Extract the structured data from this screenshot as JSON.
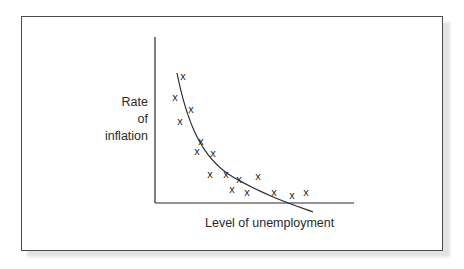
{
  "chart_data": {
    "type": "scatter",
    "title": "",
    "xlabel": "Level of unemployment",
    "ylabel": "Rate of inflation",
    "ylabel_lines": [
      "Rate",
      "of",
      "inflation"
    ],
    "grid": false,
    "legend": null,
    "ticks": "none",
    "marker": "x",
    "points_px": [
      {
        "x": 183,
        "y": 76
      },
      {
        "x": 175,
        "y": 97
      },
      {
        "x": 191,
        "y": 109
      },
      {
        "x": 180,
        "y": 121
      },
      {
        "x": 201,
        "y": 141
      },
      {
        "x": 197,
        "y": 151
      },
      {
        "x": 213,
        "y": 153
      },
      {
        "x": 210,
        "y": 174
      },
      {
        "x": 226,
        "y": 174
      },
      {
        "x": 239,
        "y": 179
      },
      {
        "x": 258,
        "y": 176
      },
      {
        "x": 232,
        "y": 189
      },
      {
        "x": 247,
        "y": 192
      },
      {
        "x": 274,
        "y": 192
      },
      {
        "x": 292,
        "y": 195
      },
      {
        "x": 306,
        "y": 192
      }
    ],
    "series": [
      {
        "name": "observations",
        "type": "scatter",
        "x": [
          0.14,
          0.1,
          0.18,
          0.13,
          0.23,
          0.21,
          0.29,
          0.28,
          0.36,
          0.42,
          0.52,
          0.39,
          0.46,
          0.6,
          0.69,
          0.76
        ],
        "y": [
          0.77,
          0.64,
          0.57,
          0.49,
          0.37,
          0.31,
          0.3,
          0.17,
          0.17,
          0.14,
          0.16,
          0.08,
          0.07,
          0.07,
          0.05,
          0.07
        ]
      },
      {
        "name": "Phillips curve",
        "type": "line",
        "shape": "convex decreasing curve (hyperbola-like), crosses the x-axis near the right",
        "path_px": "M177,73 C186,118 200,158 233,177 C262,194 288,203 313,212"
      }
    ],
    "axes_px": {
      "origin": {
        "x": 155,
        "y": 203
      },
      "y_top": 37,
      "x_right": 354
    },
    "xlim": [
      0,
      1
    ],
    "ylim": [
      0,
      1
    ]
  },
  "labels": {
    "y_line1": "Rate",
    "y_line2": "of",
    "y_line3": "inflation",
    "x": "Level of unemployment"
  },
  "colors": {
    "ink": "#2a2a2a",
    "frame": "#4a4a4a",
    "shadow": "#e2e2e2",
    "background": "#ffffff"
  }
}
